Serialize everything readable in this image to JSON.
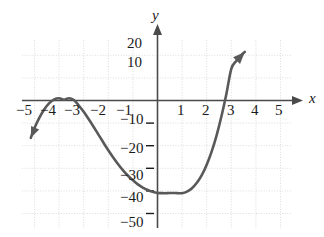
{
  "figure": {
    "axis_label_x": "x",
    "axis_label_y": "y",
    "curve_color": "#595959",
    "axis_color": "#3d3d3d",
    "grid_color": "#d9d9d9",
    "text_color": "#1a1a1a"
  },
  "chart_data": {
    "type": "line",
    "title": "",
    "xlabel": "x",
    "ylabel": "y",
    "xlim": [
      -5.8,
      5.8
    ],
    "ylim": [
      -53,
      24
    ],
    "grid": true,
    "legend": null,
    "x_ticks": [
      -5,
      -4,
      -3,
      -2,
      -1,
      1,
      2,
      3,
      4,
      5
    ],
    "x_tick_labels": [
      "−5",
      "−4",
      "−3",
      "−2",
      "−1",
      "1",
      "2",
      "3",
      "4",
      "5"
    ],
    "y_ticks": [
      20,
      10,
      -10,
      -20,
      -30,
      -40,
      -50
    ],
    "y_tick_labels": [
      "20",
      "10",
      "−10",
      "−20",
      "−30",
      "−40",
      "−50"
    ],
    "x_grid_lines": [
      -5,
      -4,
      -3,
      -2,
      -1,
      0,
      1,
      2,
      3,
      4,
      5
    ],
    "y_grid_lines": [
      20,
      10,
      0,
      -10,
      -20,
      -30,
      -40,
      -50
    ],
    "series": [
      {
        "name": "cubic curve",
        "arrow_start": true,
        "arrow_end": true,
        "roots": [
          -3.85,
          -3.35,
          3
        ],
        "local_max": {
          "x": -3.6,
          "y": 1
        },
        "local_min": {
          "x": 1.0,
          "y": -41
        },
        "x": [
          -5.15,
          -5.0,
          -4.8,
          -4.6,
          -4.4,
          -4.2,
          -4.0,
          -3.8,
          -3.6,
          -3.4,
          -3.2,
          -3.0,
          -2.8,
          -2.6,
          -2.4,
          -2.2,
          -2.0,
          -1.8,
          -1.6,
          -1.4,
          -1.2,
          -1.0,
          -0.8,
          -0.6,
          -0.4,
          -0.2,
          0.0,
          0.2,
          0.4,
          0.6,
          0.8,
          1.0,
          1.2,
          1.4,
          1.6,
          1.8,
          2.0,
          2.2,
          2.4,
          2.6,
          2.8,
          3.0,
          3.2,
          3.4,
          3.55
        ],
        "y": [
          -16.5,
          -12.2,
          -7.6,
          -3.9,
          -1.2,
          0.5,
          1.0,
          0.3,
          1.0,
          0.2,
          -2.2,
          -5.0,
          -8.2,
          -11.6,
          -15.1,
          -18.6,
          -22.0,
          -25.2,
          -28.2,
          -30.9,
          -33.3,
          -35.3,
          -37.1,
          -38.5,
          -39.6,
          -40.4,
          -40.9,
          -41.0,
          -41.0,
          -40.9,
          -41.0,
          -41.0,
          -40.3,
          -38.8,
          -36.4,
          -33.0,
          -28.4,
          -22.6,
          -15.5,
          -7.0,
          2.9,
          14.0,
          17.5,
          20.0,
          21.5
        ]
      }
    ]
  },
  "tick_labels_x": [
    {
      "text": "−5",
      "left": 16,
      "top": 103
    },
    {
      "text": "−4",
      "left": 40,
      "top": 103
    },
    {
      "text": "−3",
      "left": 64,
      "top": 103
    },
    {
      "text": "−2",
      "left": 90,
      "top": 103
    },
    {
      "text": "−1",
      "left": 116,
      "top": 103
    },
    {
      "text": "1",
      "left": 177,
      "top": 103
    },
    {
      "text": "2",
      "left": 202,
      "top": 103
    },
    {
      "text": "3",
      "left": 227,
      "top": 103
    },
    {
      "text": "4",
      "left": 251,
      "top": 103
    },
    {
      "text": "5",
      "left": 275,
      "top": 103
    }
  ],
  "tick_labels_y": [
    {
      "text": "20",
      "left": 127,
      "top": 36
    },
    {
      "text": "10",
      "left": 127,
      "top": 55
    },
    {
      "text": "−10",
      "left": 120,
      "top": 112
    },
    {
      "text": "−20",
      "left": 120,
      "top": 141
    },
    {
      "text": "−30",
      "left": 120,
      "top": 168
    },
    {
      "text": "−40",
      "left": 120,
      "top": 190
    },
    {
      "text": "−50",
      "left": 120,
      "top": 215
    }
  ],
  "axis_labels": [
    {
      "text": "y",
      "left": 152,
      "top": 8
    },
    {
      "text": "x",
      "left": 309,
      "top": 91
    }
  ]
}
